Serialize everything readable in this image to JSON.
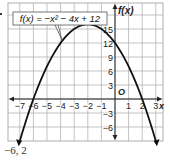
{
  "chart_data": {
    "type": "line",
    "title": "",
    "function_label": "f(x) = −x² − 4x + 12",
    "xlabel": "x",
    "ylabel": "f(x)",
    "origin_label": "O",
    "xlim": [
      -7.6,
      3.4
    ],
    "ylim": [
      -9,
      20.5
    ],
    "x_ticks": [
      -7,
      -6,
      -5,
      -4,
      -3,
      -2,
      -1,
      1,
      2,
      3
    ],
    "x_tick_labels": [
      "−7",
      "−6",
      "−5",
      "−4",
      "−3",
      "−2",
      "−1",
      "1",
      "2",
      "3"
    ],
    "y_ticks": [
      -6,
      -3,
      3,
      6,
      9,
      12,
      15
    ],
    "y_tick_labels": [
      "−6",
      "−3",
      "3",
      "6",
      "9",
      "12",
      "15"
    ],
    "grid": true,
    "series": [
      {
        "name": "f(x) = −x² − 4x + 12",
        "x": [
          -7,
          -6,
          -5,
          -4,
          -3,
          -2,
          -1,
          0,
          1,
          2,
          3
        ],
        "values": [
          -9,
          0,
          7,
          12,
          15,
          16,
          15,
          12,
          7,
          0,
          -9
        ]
      }
    ],
    "vertex": [
      -2,
      16
    ],
    "zeros": [
      -6,
      2
    ],
    "y_intercept": 12
  },
  "answer": {
    "text": "−6, 2"
  }
}
